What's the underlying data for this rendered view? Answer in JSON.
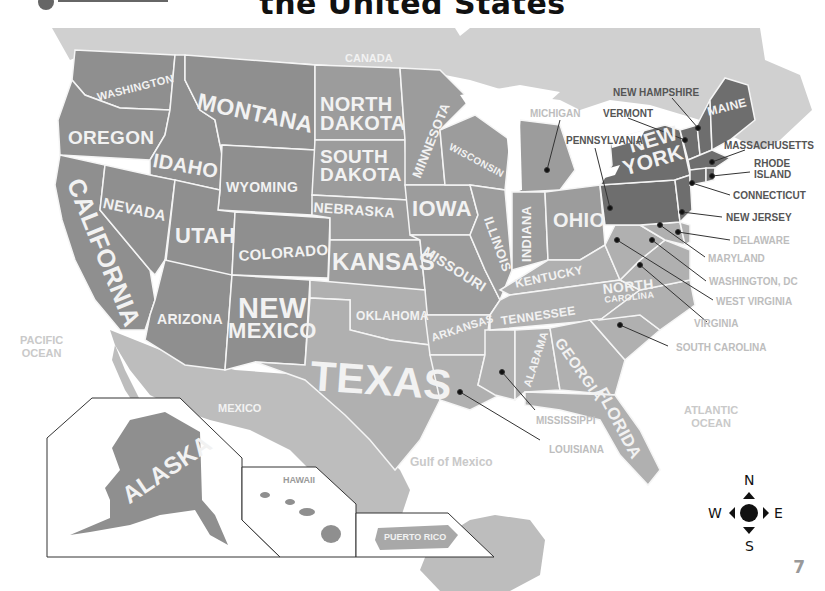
{
  "header": {
    "title_fragment": "the United States"
  },
  "colors": {
    "canada_land": "#d0d0d0",
    "mexico_land": "#bdbdbd",
    "state_west": "#8f8f8f",
    "state_central": "#9c9c9c",
    "state_south": "#b0b0b0",
    "state_northeast": "#6e6e6e",
    "state_border": "#f5f5f5",
    "water": "#ffffff",
    "label_light": "#f2f2f2",
    "callout_dark": "#555555",
    "callout_light": "#bdbdbd"
  },
  "geography": {
    "countries": [
      {
        "name": "CANADA"
      },
      {
        "name": "MEXICO"
      }
    ],
    "water_bodies": [
      {
        "name": "PACIFIC OCEAN",
        "line1": "PACIFIC",
        "line2": "OCEAN"
      },
      {
        "name": "ATLANTIC OCEAN",
        "line1": "ATLANTIC",
        "line2": "OCEAN"
      },
      {
        "name": "Gulf of Mexico"
      }
    ]
  },
  "states_inline": [
    {
      "name": "WASHINGTON"
    },
    {
      "name": "OREGON"
    },
    {
      "name": "CALIFORNIA"
    },
    {
      "name": "IDAHO"
    },
    {
      "name": "NEVADA"
    },
    {
      "name": "MONTANA"
    },
    {
      "name": "WYOMING"
    },
    {
      "name": "UTAH"
    },
    {
      "name": "COLORADO"
    },
    {
      "name": "ARIZONA"
    },
    {
      "name": "NEW",
      "line2": "MEXICO"
    },
    {
      "name": "NORTH",
      "line2": "DAKOTA"
    },
    {
      "name": "SOUTH",
      "line2": "DAKOTA"
    },
    {
      "name": "NEBRASKA"
    },
    {
      "name": "KANSAS"
    },
    {
      "name": "OKLAHOMA"
    },
    {
      "name": "TEXAS"
    },
    {
      "name": "MINNESOTA"
    },
    {
      "name": "IOWA"
    },
    {
      "name": "MISSOURI"
    },
    {
      "name": "ARKANSAS"
    },
    {
      "name": "WISCONSIN"
    },
    {
      "name": "ILLINOIS"
    },
    {
      "name": "INDIANA"
    },
    {
      "name": "OHIO"
    },
    {
      "name": "KENTUCKY"
    },
    {
      "name": "TENNESSEE"
    },
    {
      "name": "ALABAMA"
    },
    {
      "name": "GEORGIA"
    },
    {
      "name": "FLORIDA"
    },
    {
      "name": "NORTH",
      "line2": "CAROLINA"
    },
    {
      "name": "NEW",
      "line2": "YORK"
    },
    {
      "name": "MAINE"
    }
  ],
  "states_callout": [
    {
      "name": "MICHIGAN",
      "tone": "light"
    },
    {
      "name": "NEW HAMPSHIRE",
      "tone": "dark"
    },
    {
      "name": "VERMONT",
      "tone": "dark"
    },
    {
      "name": "PENNSYLVANIA",
      "tone": "dark"
    },
    {
      "name": "MASSACHUSETTS",
      "tone": "dark"
    },
    {
      "name": "RHODE",
      "line2": "ISLAND",
      "tone": "dark"
    },
    {
      "name": "CONNECTICUT",
      "tone": "dark"
    },
    {
      "name": "NEW JERSEY",
      "tone": "dark"
    },
    {
      "name": "DELAWARE",
      "tone": "light"
    },
    {
      "name": "MARYLAND",
      "tone": "light"
    },
    {
      "name": "WASHINGTON, DC",
      "tone": "light"
    },
    {
      "name": "WEST VIRGINIA",
      "tone": "light"
    },
    {
      "name": "VIRGINIA",
      "tone": "light"
    },
    {
      "name": "SOUTH CAROLINA",
      "tone": "light"
    },
    {
      "name": "MISSISSIPPI",
      "tone": "light"
    },
    {
      "name": "LOUISIANA",
      "tone": "light"
    }
  ],
  "insets": [
    {
      "name": "ALASKA"
    },
    {
      "name": "HAWAII"
    },
    {
      "name": "PUERTO RICO"
    }
  ],
  "compass": {
    "north": "N",
    "south": "S",
    "east": "E",
    "west": "W"
  },
  "page_number": "7"
}
